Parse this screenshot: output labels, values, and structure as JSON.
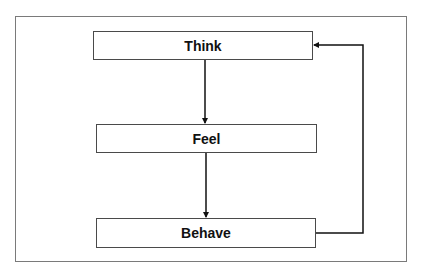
{
  "diagram": {
    "type": "flowchart",
    "nodes": [
      {
        "id": "think",
        "label": "Think"
      },
      {
        "id": "feel",
        "label": "Feel"
      },
      {
        "id": "behave",
        "label": "Behave"
      }
    ],
    "edges": [
      {
        "from": "think",
        "to": "feel"
      },
      {
        "from": "feel",
        "to": "behave"
      },
      {
        "from": "behave",
        "to": "think"
      }
    ],
    "colors": {
      "line": "#111111",
      "box_border": "#4a4a4a",
      "frame_border": "#7a7a7a",
      "background": "#ffffff"
    }
  }
}
